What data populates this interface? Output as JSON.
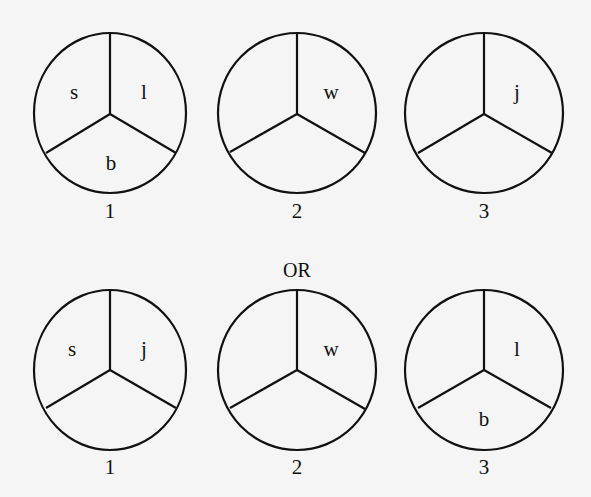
{
  "separator": "OR",
  "arrangements": [
    {
      "circles": [
        {
          "number": "1",
          "left": "s",
          "right": "l",
          "bottom": "b"
        },
        {
          "number": "2",
          "left": "",
          "right": "w",
          "bottom": ""
        },
        {
          "number": "3",
          "left": "",
          "right": "j",
          "bottom": ""
        }
      ]
    },
    {
      "circles": [
        {
          "number": "1",
          "left": "s",
          "right": "j",
          "bottom": ""
        },
        {
          "number": "2",
          "left": "",
          "right": "w",
          "bottom": ""
        },
        {
          "number": "3",
          "left": "",
          "right": "l",
          "bottom": "b"
        }
      ]
    }
  ]
}
